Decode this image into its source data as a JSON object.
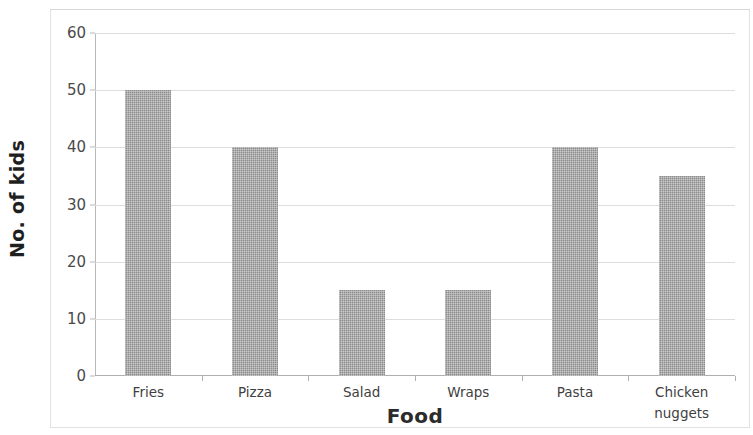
{
  "chart_data": {
    "type": "bar",
    "title": "Kids' favorite foods",
    "xlabel": "Food",
    "ylabel": "No. of kids",
    "categories": [
      "Fries",
      "Pizza",
      "Salad",
      "Wraps",
      "Pasta",
      "Chicken nuggets"
    ],
    "values": [
      50,
      40,
      15,
      15,
      40,
      35
    ],
    "ylim": [
      0,
      60
    ],
    "ytick_labels": [
      "0",
      "10",
      "20",
      "30",
      "40",
      "50",
      "60"
    ],
    "ytick_values": [
      0,
      10,
      20,
      30,
      40,
      50,
      60
    ],
    "grid": true,
    "legend": false,
    "bar_color": "#8c8c8c",
    "gridline_color": "#dddddd",
    "axis_color": "#b0b0b0",
    "background": "#ffffff"
  },
  "axis_titles": {
    "x": "Food",
    "y": "No. of kids"
  },
  "category_labels": [
    {
      "line1": "Fries",
      "line2": ""
    },
    {
      "line1": "Pizza",
      "line2": ""
    },
    {
      "line1": "Salad",
      "line2": ""
    },
    {
      "line1": "Wraps",
      "line2": ""
    },
    {
      "line1": "Pasta",
      "line2": ""
    },
    {
      "line1": "Chicken",
      "line2": "nuggets"
    }
  ]
}
